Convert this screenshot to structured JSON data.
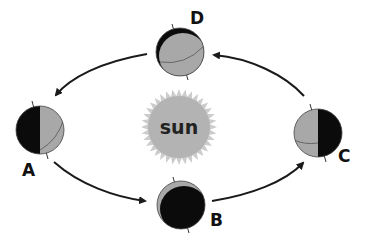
{
  "diagram": {
    "center": {
      "label": "sun",
      "fill": "#b3b3b3",
      "rays": "#c8c8c8"
    },
    "colors": {
      "lit": "#a8a8a8",
      "dark": "#0b0b0b",
      "arrow": "#1a1a1a",
      "text": "#111111"
    },
    "positions": [
      {
        "id": "A",
        "label": "A",
        "lit_side": "right"
      },
      {
        "id": "B",
        "label": "B",
        "lit_side": "top"
      },
      {
        "id": "C",
        "label": "C",
        "lit_side": "left"
      },
      {
        "id": "D",
        "label": "D",
        "lit_side": "bottom"
      }
    ],
    "arrows": [
      {
        "from": "D",
        "to": "A"
      },
      {
        "from": "A",
        "to": "B"
      },
      {
        "from": "B",
        "to": "C"
      },
      {
        "from": "C",
        "to": "D"
      }
    ]
  }
}
